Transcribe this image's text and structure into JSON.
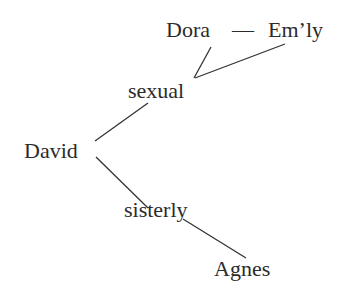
{
  "diagram": {
    "nodes": {
      "dora": "Dora",
      "dash": "—",
      "emly": "Em’ly",
      "sexual": "sexual",
      "david": "David",
      "sisterly": "sisterly",
      "agnes": "Agnes"
    },
    "edges": [
      {
        "from": "David",
        "to": "sexual"
      },
      {
        "from": "sexual",
        "to": "Dora"
      },
      {
        "from": "sexual",
        "to": "Em’ly"
      },
      {
        "from": "Dora",
        "to": "Em’ly",
        "style": "dash"
      },
      {
        "from": "David",
        "to": "sisterly"
      },
      {
        "from": "sisterly",
        "to": "Agnes"
      }
    ],
    "colors": {
      "text": "#2b2b2b",
      "line": "#333333",
      "background": "#ffffff"
    }
  }
}
